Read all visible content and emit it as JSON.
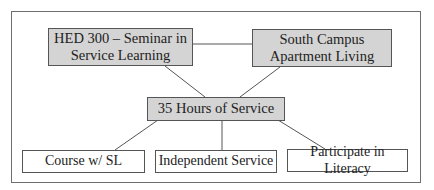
{
  "diagram": {
    "type": "hierarchy",
    "colors": {
      "shaded_fill": "#d4d4d4",
      "plain_fill": "#ffffff",
      "stroke": "#555555"
    },
    "top_nodes": [
      {
        "id": "hed300",
        "line1": "HED 300 – Seminar in",
        "line2": "Service Learning"
      },
      {
        "id": "south_campus",
        "line1": "South Campus",
        "line2": "Apartment Living"
      }
    ],
    "center_node": {
      "id": "hours",
      "label": "35 Hours of Service"
    },
    "bottom_nodes": [
      {
        "id": "course",
        "label": "Course w/ SL"
      },
      {
        "id": "independent",
        "label": "Independent Service"
      },
      {
        "id": "literacy",
        "label": "Participate in Literacy"
      }
    ],
    "edges": [
      [
        "hed300",
        "south_campus"
      ],
      [
        "hed300",
        "hours"
      ],
      [
        "south_campus",
        "hours"
      ],
      [
        "hours",
        "course"
      ],
      [
        "hours",
        "independent"
      ],
      [
        "hours",
        "literacy"
      ]
    ]
  }
}
